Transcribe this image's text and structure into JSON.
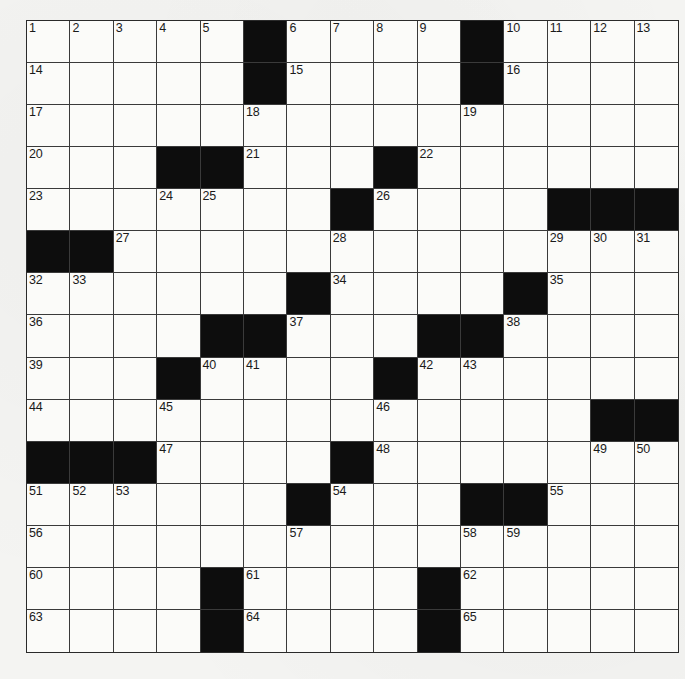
{
  "puzzle": {
    "rows": 15,
    "cols": 15,
    "colors": {
      "background": "#f4f4f2",
      "cell": "#fbfbf9",
      "block": "#0d0d0d",
      "line": "#3a3a3a"
    },
    "grid": [
      [
        "1",
        "2",
        "3",
        "4",
        "5",
        "#",
        "6",
        "7",
        "8",
        "9",
        "#",
        "10",
        "11",
        "12",
        "13"
      ],
      [
        "14",
        ".",
        ".",
        ".",
        ".",
        "#",
        "15",
        ".",
        ".",
        ".",
        "#",
        "16",
        ".",
        ".",
        "."
      ],
      [
        "17",
        ".",
        ".",
        ".",
        ".",
        "18",
        ".",
        ".",
        ".",
        ".",
        "19",
        ".",
        ".",
        ".",
        "."
      ],
      [
        "20",
        ".",
        ".",
        "#",
        "#",
        "21",
        ".",
        ".",
        "#",
        "22",
        ".",
        ".",
        ".",
        ".",
        "."
      ],
      [
        "23",
        ".",
        ".",
        "24",
        "25",
        ".",
        ".",
        "#",
        "26",
        ".",
        ".",
        ".",
        "#",
        "#",
        "#"
      ],
      [
        "#",
        "#",
        "27",
        ".",
        ".",
        ".",
        ".",
        "28",
        ".",
        ".",
        ".",
        ".",
        "29",
        "30",
        "31"
      ],
      [
        "32",
        "33",
        ".",
        ".",
        ".",
        ".",
        "#",
        "34",
        ".",
        ".",
        ".",
        "#",
        "35",
        ".",
        "."
      ],
      [
        "36",
        ".",
        ".",
        ".",
        "#",
        "#",
        "37",
        ".",
        ".",
        "#",
        "#",
        "38",
        ".",
        ".",
        "."
      ],
      [
        "39",
        ".",
        ".",
        "#",
        "40",
        "41",
        ".",
        ".",
        "#",
        "42",
        "43",
        ".",
        ".",
        ".",
        "."
      ],
      [
        "44",
        ".",
        ".",
        "45",
        ".",
        ".",
        ".",
        ".",
        "46",
        ".",
        ".",
        ".",
        ".",
        "#",
        "#"
      ],
      [
        "#",
        "#",
        "#",
        "47",
        ".",
        ".",
        ".",
        "#",
        "48",
        ".",
        ".",
        ".",
        ".",
        "49",
        "50"
      ],
      [
        "51",
        "52",
        "53",
        ".",
        ".",
        ".",
        "#",
        "54",
        ".",
        ".",
        "#",
        "#",
        "55",
        ".",
        "."
      ],
      [
        "56",
        ".",
        ".",
        ".",
        ".",
        ".",
        "57",
        ".",
        ".",
        ".",
        "58",
        "59",
        ".",
        ".",
        "."
      ],
      [
        "60",
        ".",
        ".",
        ".",
        "#",
        "61",
        ".",
        ".",
        ".",
        "#",
        "62",
        ".",
        ".",
        ".",
        "."
      ],
      [
        "63",
        ".",
        ".",
        ".",
        "#",
        "64",
        ".",
        ".",
        ".",
        "#",
        "65",
        ".",
        ".",
        ".",
        "."
      ]
    ],
    "entries": [
      [
        "",
        "",
        "",
        "",
        "",
        "",
        "",
        "",
        "",
        "",
        "",
        "",
        "",
        "",
        ""
      ],
      [
        "",
        "",
        "",
        "",
        "",
        "",
        "",
        "",
        "",
        "",
        "",
        "",
        "",
        "",
        ""
      ],
      [
        "",
        "",
        "",
        "",
        "",
        "",
        "",
        "",
        "",
        "",
        "",
        "",
        "",
        "",
        ""
      ],
      [
        "",
        "",
        "",
        "",
        "",
        "",
        "",
        "",
        "",
        "",
        "",
        "",
        "",
        "",
        ""
      ],
      [
        "",
        "",
        "",
        "",
        "",
        "",
        "",
        "",
        "",
        "",
        "",
        "",
        "",
        "",
        ""
      ],
      [
        "",
        "",
        "",
        "",
        "",
        "",
        "",
        "",
        "",
        "",
        "",
        "",
        "",
        "",
        ""
      ],
      [
        "",
        "",
        "",
        "",
        "",
        "",
        "",
        "",
        "",
        "",
        "",
        "",
        "",
        "",
        ""
      ],
      [
        "",
        "",
        "",
        "",
        "",
        "",
        "",
        "",
        "",
        "",
        "",
        "",
        "",
        "",
        ""
      ],
      [
        "",
        "",
        "",
        "",
        "",
        "",
        "",
        "",
        "",
        "",
        "",
        "",
        "",
        "",
        ""
      ],
      [
        "",
        "",
        "",
        "",
        "",
        "",
        "",
        "",
        "",
        "",
        "",
        "",
        "",
        "",
        ""
      ],
      [
        "",
        "",
        "",
        "",
        "",
        "",
        "",
        "",
        "",
        "",
        "",
        "",
        "",
        "",
        ""
      ],
      [
        "",
        "",
        "",
        "",
        "",
        "",
        "",
        "",
        "",
        "",
        "",
        "",
        "",
        "",
        ""
      ],
      [
        "",
        "",
        "",
        "",
        "",
        "",
        "",
        "",
        "",
        "",
        "",
        "",
        "",
        "",
        ""
      ],
      [
        "",
        "",
        "",
        "",
        "",
        "",
        "",
        "",
        "",
        "",
        "",
        "",
        "",
        "",
        ""
      ],
      [
        "",
        "",
        "",
        "",
        "",
        "",
        "",
        "",
        "",
        "",
        "",
        "",
        "",
        "",
        ""
      ]
    ]
  }
}
